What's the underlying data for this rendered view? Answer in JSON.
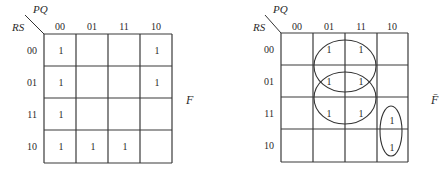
{
  "maps": [
    {
      "id": "F",
      "row_var": "RS",
      "col_var": "PQ",
      "output_label": "F",
      "col_headers": [
        "00",
        "01",
        "11",
        "10"
      ],
      "row_headers": [
        "00",
        "01",
        "11",
        "10"
      ],
      "cells": [
        [
          "1",
          "",
          "",
          "1"
        ],
        [
          "1",
          "",
          "",
          "1"
        ],
        [
          "1",
          "",
          "",
          ""
        ],
        [
          "1",
          "1",
          "1",
          ""
        ]
      ]
    },
    {
      "id": "F_bar",
      "row_var": "RS",
      "col_var": "PQ",
      "output_label": "F̄",
      "col_headers": [
        "00",
        "01",
        "11",
        "10"
      ],
      "row_headers": [
        "00",
        "01",
        "11",
        "10"
      ],
      "cells": [
        [
          "",
          "1",
          "1",
          ""
        ],
        [
          "",
          "1",
          "1",
          ""
        ],
        [
          "",
          "1",
          "1",
          "1"
        ],
        [
          "",
          "",
          "",
          "1"
        ]
      ],
      "groupings": [
        {
          "rows": [
            "00",
            "01"
          ],
          "cols": [
            "01",
            "11"
          ]
        },
        {
          "rows": [
            "01",
            "11"
          ],
          "cols": [
            "01",
            "11"
          ]
        },
        {
          "rows": [
            "11",
            "10"
          ],
          "cols": [
            "10"
          ]
        }
      ]
    }
  ]
}
